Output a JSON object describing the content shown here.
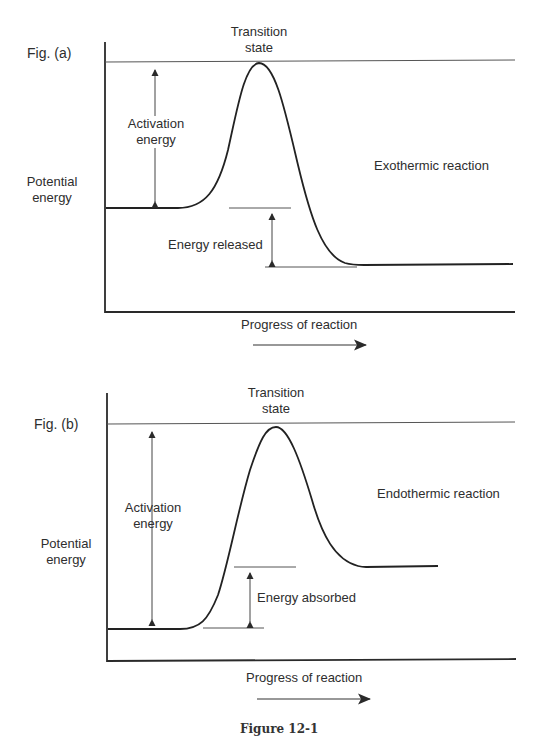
{
  "figure": {
    "caption": "Figure 12-1",
    "panels": [
      {
        "id": "a",
        "label": "Fig. (a)",
        "y_axis_label_line1": "Potential",
        "y_axis_label_line2": "energy",
        "x_axis_label": "Progress of reaction",
        "peak_label_line1": "Transition",
        "peak_label_line2": "state",
        "activation_label_line1": "Activation",
        "activation_label_line2": "energy",
        "delta_label": "Energy released",
        "reaction_type": "Exothermic reaction"
      },
      {
        "id": "b",
        "label": "Fig. (b)",
        "y_axis_label_line1": "Potential",
        "y_axis_label_line2": "energy",
        "x_axis_label": "Progress of reaction",
        "peak_label_line1": "Transition",
        "peak_label_line2": "state",
        "activation_label_line1": "Activation",
        "activation_label_line2": "energy",
        "delta_label": "Energy absorbed",
        "reaction_type": "Endothermic reaction"
      }
    ]
  },
  "colors": {
    "line": "#222222",
    "thin_line": "#555555",
    "text": "#2e2e2e",
    "background": "#ffffff"
  }
}
